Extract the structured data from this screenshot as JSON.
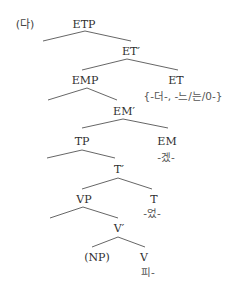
{
  "example_label": "(다)",
  "nodes": {
    "etp": "ETP",
    "et_bar": "ET′",
    "emp": "EMP",
    "et": "ET",
    "et_morphemes": "{-더-, -느/는/0-}",
    "em_bar": "EM′",
    "tp": "TP",
    "em": "EM",
    "em_morpheme": "-겠-",
    "t_bar": "T′",
    "vp": "VP",
    "t": "T",
    "t_morpheme": "-었-",
    "v_bar": "V′",
    "np": "(NP)",
    "v": "V",
    "v_morpheme": "피-"
  },
  "layout": {
    "example_label": [
      25,
      24
    ],
    "etp": [
      84,
      24
    ],
    "et_bar": [
      131,
      51
    ],
    "emp": [
      85,
      80
    ],
    "et": [
      176,
      80
    ],
    "et_morphemes": [
      183,
      96
    ],
    "em_bar": [
      124,
      111
    ],
    "tp": [
      82,
      141
    ],
    "em": [
      167,
      141
    ],
    "em_morpheme": [
      166,
      157
    ],
    "t_bar": [
      119,
      169
    ],
    "vp": [
      84,
      199
    ],
    "t": [
      154,
      199
    ],
    "t_morpheme": [
      152,
      213
    ],
    "v_bar": [
      119,
      228
    ],
    "np": [
      97,
      257
    ],
    "v": [
      144,
      257
    ],
    "v_morpheme": [
      148,
      272
    ]
  },
  "edges": [
    {
      "from": [
        85,
        31
      ],
      "to": [
        43,
        41
      ]
    },
    {
      "from": [
        85,
        31
      ],
      "to": [
        131,
        41
      ]
    },
    {
      "from": [
        127,
        59
      ],
      "to": [
        82,
        70
      ]
    },
    {
      "from": [
        127,
        59
      ],
      "to": [
        178,
        70
      ]
    },
    {
      "from": [
        87,
        88
      ],
      "to": [
        48,
        100
      ]
    },
    {
      "from": [
        87,
        88
      ],
      "to": [
        117,
        100
      ]
    },
    {
      "from": [
        123,
        119
      ],
      "to": [
        82,
        128
      ]
    },
    {
      "from": [
        123,
        119
      ],
      "to": [
        168,
        128
      ]
    },
    {
      "from": [
        82,
        150
      ],
      "to": [
        47,
        158
      ]
    },
    {
      "from": [
        82,
        150
      ],
      "to": [
        115,
        158
      ]
    },
    {
      "from": [
        118,
        178
      ],
      "to": [
        82,
        189
      ]
    },
    {
      "from": [
        118,
        178
      ],
      "to": [
        152,
        189
      ]
    },
    {
      "from": [
        83,
        207
      ],
      "to": [
        50,
        218
      ]
    },
    {
      "from": [
        83,
        207
      ],
      "to": [
        118,
        218
      ]
    },
    {
      "from": [
        118,
        237
      ],
      "to": [
        92,
        247
      ]
    },
    {
      "from": [
        118,
        237
      ],
      "to": [
        145,
        247
      ]
    }
  ]
}
